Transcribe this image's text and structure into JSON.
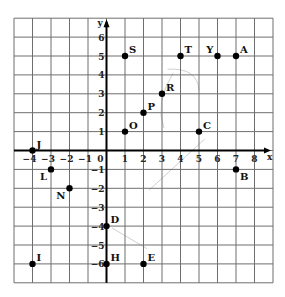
{
  "chart_data": {
    "type": "scatter",
    "title": "",
    "xlabel": "x",
    "ylabel": "y",
    "xlim": [
      -5,
      9
    ],
    "ylim": [
      -7,
      7
    ],
    "grid": true,
    "x_ticks": [
      -4,
      -3,
      -2,
      -1,
      0,
      1,
      2,
      3,
      4,
      5,
      6,
      7,
      8
    ],
    "y_ticks": [
      6,
      5,
      4,
      3,
      2,
      1,
      -1,
      -2,
      -3,
      -4,
      -5,
      -6
    ],
    "points": [
      {
        "label": "J",
        "x": -4,
        "y": 0,
        "label_pos": "ur"
      },
      {
        "label": "L",
        "x": -3,
        "y": -1,
        "label_pos": "ll"
      },
      {
        "label": "N",
        "x": -2,
        "y": -2,
        "label_pos": "ll"
      },
      {
        "label": "I",
        "x": -4,
        "y": -6,
        "label_pos": "ur"
      },
      {
        "label": "D",
        "x": 0,
        "y": -4,
        "label_pos": "ur"
      },
      {
        "label": "H",
        "x": 0,
        "y": -6,
        "label_pos": "ur"
      },
      {
        "label": "E",
        "x": 2,
        "y": -6,
        "label_pos": "ur"
      },
      {
        "label": "O",
        "x": 1,
        "y": 1,
        "label_pos": "ur"
      },
      {
        "label": "P",
        "x": 2,
        "y": 2,
        "label_pos": "ur"
      },
      {
        "label": "R",
        "x": 3,
        "y": 3,
        "label_pos": "ur"
      },
      {
        "label": "S",
        "x": 1,
        "y": 5,
        "label_pos": "ur"
      },
      {
        "label": "T",
        "x": 4,
        "y": 5,
        "label_pos": "ur"
      },
      {
        "label": "Y",
        "x": 6,
        "y": 5,
        "label_pos": "ul"
      },
      {
        "label": "A",
        "x": 7,
        "y": 5,
        "label_pos": "ur"
      },
      {
        "label": "C",
        "x": 5,
        "y": 1,
        "label_pos": "ur"
      },
      {
        "label": "B",
        "x": 7,
        "y": -1,
        "label_pos": "lr"
      }
    ],
    "colors": {
      "grid": "#6e6e6e",
      "axis": "#000000",
      "point": "#000000"
    }
  }
}
